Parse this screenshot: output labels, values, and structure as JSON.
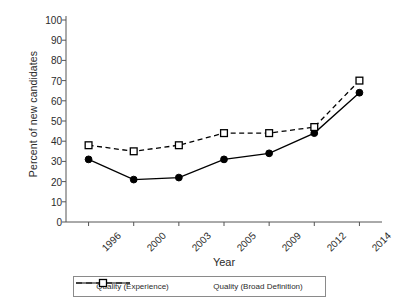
{
  "chart_data": {
    "type": "line",
    "title": "",
    "xlabel": "Year",
    "ylabel": "Percent of new candidates",
    "categories": [
      "1996",
      "2000",
      "2003",
      "2005",
      "2009",
      "2012",
      "2014"
    ],
    "ylim": [
      0,
      100
    ],
    "ytick_labels": [
      "0",
      "10",
      "20",
      "30",
      "40",
      "50",
      "60",
      "70",
      "80",
      "90",
      "100"
    ],
    "ytick_values": [
      0,
      10,
      20,
      30,
      40,
      50,
      60,
      70,
      80,
      90,
      100
    ],
    "grid": false,
    "legend_position": "bottom",
    "series": [
      {
        "name": "Quality (Experience)",
        "marker": "filled-circle",
        "linestyle": "solid",
        "color": "#000000",
        "values": [
          31,
          21,
          22,
          31,
          34,
          44,
          64
        ]
      },
      {
        "name": "Quality (Broad Definition)",
        "marker": "open-square",
        "linestyle": "dashed",
        "color": "#000000",
        "values": [
          38,
          35,
          38,
          44,
          44,
          47,
          70
        ]
      }
    ]
  },
  "axis": {
    "x_title": "Year",
    "y_title": "Percent of new candidates"
  },
  "legend": {
    "entries": [
      {
        "label": "Quality (Experience)"
      },
      {
        "label": "Quality (Broad Definition)"
      }
    ]
  }
}
